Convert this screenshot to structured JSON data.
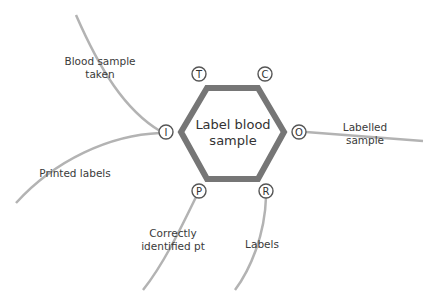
{
  "diagram": {
    "center": {
      "label_line1": "Label blood",
      "label_line2": "sample"
    },
    "colors": {
      "hexagon_stroke": "#767676",
      "line": "#b3b3b3",
      "node_stroke": "#555555",
      "text": "#3a3a3a"
    },
    "nodes": [
      {
        "id": "T",
        "letter": "T"
      },
      {
        "id": "C",
        "letter": "C"
      },
      {
        "id": "I",
        "letter": "I"
      },
      {
        "id": "O",
        "letter": "O"
      },
      {
        "id": "P",
        "letter": "P"
      },
      {
        "id": "R",
        "letter": "R"
      }
    ],
    "labels": {
      "blood_sample_line1": "Blood sample",
      "blood_sample_line2": "taken",
      "printed_labels": "Printed labels",
      "labelled_line1": "Labelled",
      "labelled_line2": "sample",
      "correctly_line1": "Correctly",
      "correctly_line2": "identified pt",
      "labels": "Labels"
    }
  }
}
